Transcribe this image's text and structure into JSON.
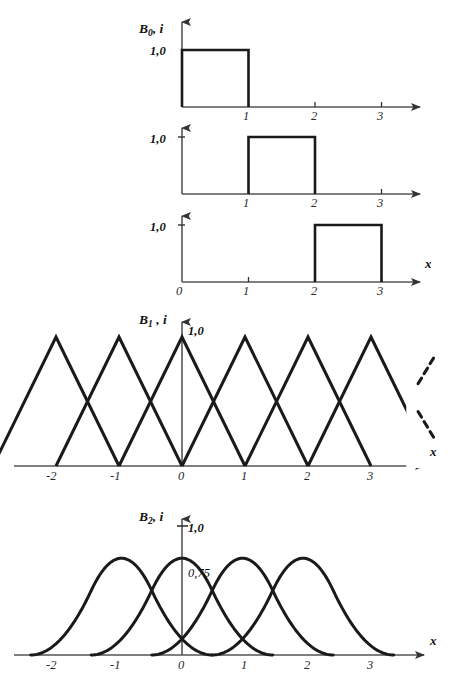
{
  "figure": {
    "background": "#ffffff",
    "stroke_color": "#1a1a1a",
    "axis_color": "#555555",
    "x_axis_label": "x"
  },
  "panels": [
    {
      "id": "b0-panel-1",
      "series_label_base": "B",
      "series_label_sub": "0",
      "series_label_rest": ", i",
      "y_value_label": "1,0",
      "x_ticks": [
        "1",
        "2",
        "3"
      ],
      "show_x_axis_name": false,
      "show_origin_label": false
    },
    {
      "id": "b0-panel-2",
      "y_value_label": "1,0",
      "x_ticks": [
        "1",
        "2",
        "3"
      ],
      "show_x_axis_name": false,
      "show_origin_label": false
    },
    {
      "id": "b0-panel-3",
      "y_value_label": "1,0",
      "x_ticks": [
        "0",
        "1",
        "2",
        "3"
      ],
      "show_x_axis_name": true,
      "show_origin_label": true
    },
    {
      "id": "b1-panel",
      "series_label_base": "B",
      "series_label_sub": "1",
      "series_label_rest": " , i",
      "y_value_label": "1,0",
      "x_ticks": [
        "-2",
        "-1",
        "0",
        "1",
        "2",
        "3"
      ],
      "show_x_axis_name": true
    },
    {
      "id": "b2-panel",
      "series_label_base": "B",
      "series_label_sub": "2",
      "series_label_rest": ", i",
      "y_value_label": "1,0",
      "y_peak_label": "0,75",
      "x_ticks": [
        "-2",
        "-1",
        "0",
        "1",
        "2",
        "3"
      ],
      "show_x_axis_name": true
    }
  ],
  "chart_data": {
    "type": "line",
    "title": "",
    "xlabel": "x",
    "ylabel": "",
    "charts": [
      {
        "name": "B0,i degree-0 basis (panel 1)",
        "type": "area",
        "ylabel": "B0, i",
        "ylim": [
          0,
          1
        ],
        "xlim": [
          0,
          3.6
        ],
        "y_tick_labels": [
          "1,0"
        ],
        "y_tick_values": [
          1.0
        ],
        "x_tick_labels": [
          "1",
          "2",
          "3"
        ],
        "x_tick_values": [
          1,
          2,
          3
        ],
        "series": [
          {
            "name": "B0,0",
            "interval": [
              0,
              1
            ],
            "value": 1.0,
            "points": [
              [
                0,
                0
              ],
              [
                0,
                1
              ],
              [
                1,
                1
              ],
              [
                1,
                0
              ]
            ]
          }
        ]
      },
      {
        "name": "B0,i degree-0 basis (panel 2)",
        "type": "area",
        "ylim": [
          0,
          1
        ],
        "xlim": [
          0,
          3.6
        ],
        "y_tick_labels": [
          "1,0"
        ],
        "y_tick_values": [
          1.0
        ],
        "x_tick_labels": [
          "1",
          "2",
          "3"
        ],
        "x_tick_values": [
          1,
          2,
          3
        ],
        "series": [
          {
            "name": "B0,1",
            "interval": [
              1,
              2
            ],
            "value": 1.0,
            "points": [
              [
                1,
                0
              ],
              [
                1,
                1
              ],
              [
                2,
                1
              ],
              [
                2,
                0
              ]
            ]
          }
        ]
      },
      {
        "name": "B0,i degree-0 basis (panel 3)",
        "type": "area",
        "ylim": [
          0,
          1
        ],
        "xlim": [
          0,
          3.6
        ],
        "y_tick_labels": [
          "1,0"
        ],
        "y_tick_values": [
          1.0
        ],
        "x_tick_labels": [
          "0",
          "1",
          "2",
          "3"
        ],
        "x_tick_values": [
          0,
          1,
          2,
          3
        ],
        "series": [
          {
            "name": "B0,2",
            "interval": [
              2,
              3
            ],
            "value": 1.0,
            "points": [
              [
                2,
                0
              ],
              [
                2,
                1
              ],
              [
                3,
                1
              ],
              [
                3,
                0
              ]
            ]
          }
        ]
      },
      {
        "name": "B1,i degree-1 (linear) basis",
        "type": "line",
        "ylabel": "B1, i",
        "ylim": [
          0,
          1
        ],
        "xlim": [
          -2.6,
          3.9
        ],
        "y_tick_labels": [
          "1,0"
        ],
        "y_tick_values": [
          1.0
        ],
        "x_tick_labels": [
          "-2",
          "-1",
          "0",
          "1",
          "2",
          "3"
        ],
        "x_tick_values": [
          -2,
          -1,
          0,
          1,
          2,
          3
        ],
        "peak_value": 1.0,
        "support_half_width": 1,
        "continuation_marker": "dashed diagonal dots at right",
        "series": [
          {
            "name": "B1 centered -2",
            "center": -2,
            "points": [
              [
                -3,
                0
              ],
              [
                -2,
                1
              ],
              [
                -1,
                0
              ]
            ]
          },
          {
            "name": "B1 centered -1",
            "center": -1,
            "points": [
              [
                -2,
                0
              ],
              [
                -1,
                1
              ],
              [
                0,
                0
              ]
            ]
          },
          {
            "name": "B1 centered 0",
            "center": 0,
            "points": [
              [
                -1,
                0
              ],
              [
                0,
                1
              ],
              [
                1,
                0
              ]
            ]
          },
          {
            "name": "B1 centered 1",
            "center": 1,
            "points": [
              [
                0,
                0
              ],
              [
                1,
                1
              ],
              [
                2,
                0
              ]
            ]
          },
          {
            "name": "B1 centered 2",
            "center": 2,
            "points": [
              [
                1,
                0
              ],
              [
                2,
                1
              ],
              [
                3,
                0
              ]
            ]
          },
          {
            "name": "B1 centered 3",
            "center": 3,
            "points": [
              [
                2,
                0
              ],
              [
                3,
                1
              ],
              [
                4,
                0
              ]
            ]
          }
        ]
      },
      {
        "name": "B2,i degree-2 (quadratic) basis",
        "type": "line",
        "ylabel": "B2, i",
        "ylim": [
          0,
          1
        ],
        "xlim": [
          -2.6,
          3.9
        ],
        "y_tick_labels": [
          "1,0",
          "0,75"
        ],
        "y_tick_values": [
          1.0,
          0.75
        ],
        "x_tick_labels": [
          "-2",
          "-1",
          "0",
          "1",
          "2",
          "3"
        ],
        "x_tick_values": [
          -2,
          -1,
          0,
          1,
          2,
          3
        ],
        "peak_value": 0.75,
        "support_half_width": 1.5,
        "series": [
          {
            "name": "B2 centered -1",
            "center": -1,
            "support": [
              -2.5,
              0.5
            ]
          },
          {
            "name": "B2 centered 0",
            "center": 0,
            "support": [
              -1.5,
              1.5
            ]
          },
          {
            "name": "B2 centered 1",
            "center": 1,
            "support": [
              -0.5,
              2.5
            ]
          },
          {
            "name": "B2 centered 2",
            "center": 2,
            "support": [
              0.5,
              3.5
            ]
          }
        ]
      }
    ]
  }
}
